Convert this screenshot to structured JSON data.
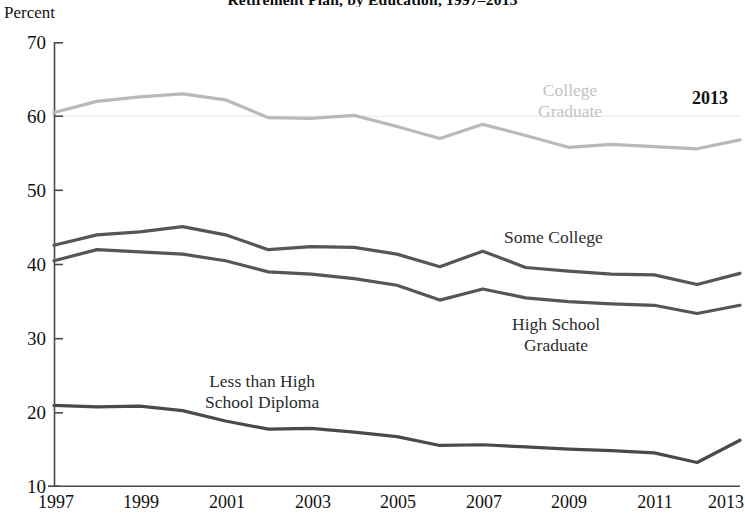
{
  "chart_data": {
    "type": "line",
    "title": "Retirement Plan, by Education, 1997–2013",
    "subtitle": "",
    "xlabel": "",
    "ylabel": "Percent",
    "ylim": [
      10,
      70
    ],
    "xlim": [
      1997,
      2013
    ],
    "yticks": [
      10,
      20,
      30,
      40,
      50,
      60,
      70
    ],
    "xticks": [
      1997,
      1999,
      2001,
      2003,
      2005,
      2007,
      2009,
      2011,
      2013
    ],
    "xtick_labels": [
      "1997",
      "1999",
      "2001",
      "2003",
      "2005",
      "2007",
      "2009",
      "2011",
      "2013"
    ],
    "ytick_labels": [
      "10",
      "20",
      "30",
      "40",
      "50",
      "60",
      "70"
    ],
    "grid": "faint horizontal line at y=60 only",
    "legend": "inline labels on plot",
    "x": [
      1997,
      1998,
      1999,
      2000,
      2001,
      2002,
      2003,
      2004,
      2005,
      2006,
      2007,
      2008,
      2009,
      2010,
      2011,
      2012,
      2013
    ],
    "series": [
      {
        "name": "College Graduate",
        "color": "#b9b9b9",
        "label_position": "upper-right",
        "values": [
          60.5,
          62.0,
          62.6,
          63.0,
          62.2,
          59.8,
          59.7,
          60.1,
          58.6,
          57.0,
          58.9,
          57.4,
          55.8,
          56.2,
          55.9,
          55.6,
          56.8
        ]
      },
      {
        "name": "Some College",
        "color": "#565656",
        "label_position": "middle-right",
        "values": [
          42.6,
          44.0,
          44.4,
          45.1,
          44.0,
          42.0,
          42.4,
          42.3,
          41.4,
          39.7,
          41.8,
          39.6,
          39.1,
          38.7,
          38.6,
          37.3,
          38.8
        ]
      },
      {
        "name": "High School Graduate",
        "color": "#565656",
        "label_position": "lower-right",
        "values": [
          40.5,
          42.0,
          41.7,
          41.4,
          40.5,
          39.0,
          38.7,
          38.1,
          37.2,
          35.2,
          36.7,
          35.5,
          35.0,
          34.7,
          34.5,
          33.4,
          34.5
        ]
      },
      {
        "name": "Less than High School Diploma",
        "color": "#4a4a4a",
        "label_position": "lower-left",
        "values": [
          21.0,
          20.8,
          20.9,
          20.3,
          18.9,
          17.8,
          17.9,
          17.4,
          16.8,
          15.6,
          15.7,
          15.4,
          15.1,
          14.9,
          14.6,
          13.3,
          16.3
        ]
      }
    ],
    "annotations": [
      {
        "name": "year-callout",
        "text": "2013"
      }
    ]
  },
  "chart": {
    "title": "Retirement Plan, by Education, 1997–2013",
    "axis_caption": "Percent",
    "year_callout": "2013",
    "labels": {
      "college_graduate": [
        "College",
        "Graduate"
      ],
      "some_college": [
        "Some College"
      ],
      "high_school_graduate": [
        "High School",
        "Graduate"
      ],
      "less_than_high_school": [
        "Less than High",
        "School Diploma"
      ]
    }
  }
}
